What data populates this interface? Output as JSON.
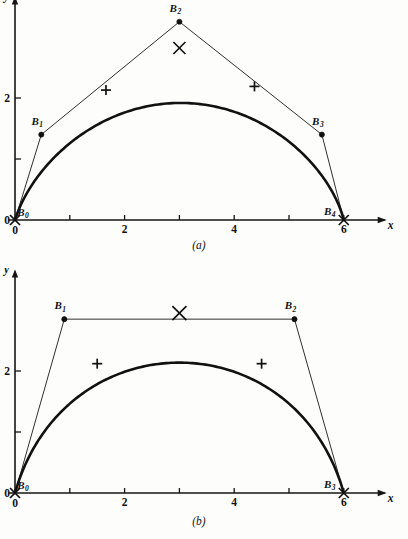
{
  "document": {
    "background_color": "#fdfdfb",
    "ink_color": "#111111"
  },
  "figures": [
    {
      "id": "a",
      "caption": "(a)",
      "axes": {
        "x_label": "x",
        "y_label": "y",
        "origin_label_y": "0",
        "origin_label_x": "0",
        "x_ticks": [
          {
            "value": 0,
            "label": "0"
          },
          {
            "value": 1,
            "label": ""
          },
          {
            "value": 2,
            "label": "2"
          },
          {
            "value": 3,
            "label": ""
          },
          {
            "value": 4,
            "label": "4"
          },
          {
            "value": 5,
            "label": ""
          },
          {
            "value": 6,
            "label": "6"
          }
        ],
        "y_ticks": [
          {
            "value": 1,
            "label": ""
          },
          {
            "value": 2,
            "label": "2"
          }
        ],
        "xlim": [
          0,
          6.6
        ],
        "ylim": [
          0,
          3.6
        ]
      },
      "control_points": [
        {
          "name": "B",
          "sub": "0",
          "x": 0.0,
          "y": 0.0,
          "label_dx": 8,
          "label_dy": -4
        },
        {
          "name": "B",
          "sub": "1",
          "x": 0.48,
          "y": 1.4,
          "label_dx": -4,
          "label_dy": -10
        },
        {
          "name": "B",
          "sub": "2",
          "x": 3.0,
          "y": 3.25,
          "label_dx": -4,
          "label_dy": -10
        },
        {
          "name": "B",
          "sub": "3",
          "x": 5.6,
          "y": 1.4,
          "label_dx": -4,
          "label_dy": -10
        },
        {
          "name": "B",
          "sub": "4",
          "x": 6.0,
          "y": 0.0,
          "label_dx": -14,
          "label_dy": -5
        }
      ],
      "curve_markers": [
        {
          "type": "x",
          "x": 0.0,
          "y": 0.0,
          "size": 5
        },
        {
          "type": "plus",
          "x": 1.66,
          "y": 2.13,
          "size": 5
        },
        {
          "type": "x",
          "x": 3.0,
          "y": 2.82,
          "size": 6
        },
        {
          "type": "plus",
          "x": 4.37,
          "y": 2.19,
          "size": 5
        },
        {
          "type": "x",
          "x": 6.0,
          "y": 0.0,
          "size": 5
        }
      ]
    },
    {
      "id": "b",
      "caption": "(b)",
      "axes": {
        "x_label": "x",
        "y_label": "y",
        "origin_label_y": "0",
        "origin_label_x": "0",
        "x_ticks": [
          {
            "value": 0,
            "label": "0"
          },
          {
            "value": 1,
            "label": ""
          },
          {
            "value": 2,
            "label": "2"
          },
          {
            "value": 3,
            "label": ""
          },
          {
            "value": 4,
            "label": "4"
          },
          {
            "value": 5,
            "label": ""
          },
          {
            "value": 6,
            "label": "6"
          }
        ],
        "y_ticks": [
          {
            "value": 1,
            "label": ""
          },
          {
            "value": 2,
            "label": "2"
          }
        ],
        "xlim": [
          0,
          6.6
        ],
        "ylim": [
          0,
          3.6
        ]
      },
      "control_points": [
        {
          "name": "B",
          "sub": "0",
          "x": 0.0,
          "y": 0.0,
          "label_dx": 8,
          "label_dy": -4
        },
        {
          "name": "B",
          "sub": "1",
          "x": 0.9,
          "y": 2.85,
          "label_dx": -4,
          "label_dy": -10
        },
        {
          "name": "B",
          "sub": "2",
          "x": 5.1,
          "y": 2.85,
          "label_dx": -4,
          "label_dy": -10
        },
        {
          "name": "B",
          "sub": "3",
          "x": 6.0,
          "y": 0.0,
          "label_dx": -14,
          "label_dy": -5
        }
      ],
      "curve_markers": [
        {
          "type": "x",
          "x": 0.0,
          "y": 0.0,
          "size": 5
        },
        {
          "type": "plus",
          "x": 1.5,
          "y": 2.12,
          "size": 5
        },
        {
          "type": "x",
          "x": 3.0,
          "y": 2.95,
          "size": 7
        },
        {
          "type": "plus",
          "x": 4.5,
          "y": 2.12,
          "size": 5
        },
        {
          "type": "x",
          "x": 6.0,
          "y": 0.0,
          "size": 5
        }
      ]
    }
  ],
  "chart_data": {
    "type": "line",
    "title": "",
    "charts": [
      {
        "id": "a",
        "caption": "(a)",
        "type": "line",
        "xlabel": "x",
        "ylabel": "y",
        "xlim": [
          0,
          6.6
        ],
        "ylim": [
          0,
          3.6
        ],
        "xticks": [
          0,
          1,
          2,
          3,
          4,
          5,
          6
        ],
        "xtick_labels": [
          "0",
          "",
          "2",
          "",
          "4",
          "",
          "6"
        ],
        "yticks": [
          1,
          2
        ],
        "ytick_labels": [
          "",
          "2"
        ],
        "grid": false,
        "legend": "none",
        "series": [
          {
            "name": "control polygon",
            "style": "thin-polyline",
            "x": [
              0.0,
              0.48,
              3.0,
              5.6,
              6.0
            ],
            "y": [
              0.0,
              1.4,
              3.25,
              1.4,
              0.0
            ]
          },
          {
            "name": "bezier curve (degree 4)",
            "style": "thick-curve",
            "x": [
              0.0,
              0.6,
              1.2,
              1.66,
              2.2,
              3.0,
              3.8,
              4.37,
              4.9,
              5.5,
              6.0
            ],
            "y": [
              0.0,
              1.12,
              1.78,
              2.13,
              2.5,
              2.82,
              2.5,
              2.19,
              1.75,
              1.0,
              0.0
            ]
          }
        ],
        "annotations": [
          {
            "text": "B0",
            "x": 0.0,
            "y": 0.0
          },
          {
            "text": "B1",
            "x": 0.48,
            "y": 1.4
          },
          {
            "text": "B2",
            "x": 3.0,
            "y": 3.25
          },
          {
            "text": "B3",
            "x": 5.6,
            "y": 1.4
          },
          {
            "text": "B4",
            "x": 6.0,
            "y": 0.0
          }
        ],
        "markers": [
          {
            "type": "x",
            "x": 0.0,
            "y": 0.0
          },
          {
            "type": "plus",
            "x": 1.66,
            "y": 2.13
          },
          {
            "type": "x",
            "x": 3.0,
            "y": 2.82
          },
          {
            "type": "plus",
            "x": 4.37,
            "y": 2.19
          },
          {
            "type": "x",
            "x": 6.0,
            "y": 0.0
          }
        ]
      },
      {
        "id": "b",
        "caption": "(b)",
        "type": "line",
        "xlabel": "x",
        "ylabel": "y",
        "xlim": [
          0,
          6.6
        ],
        "ylim": [
          0,
          3.6
        ],
        "xticks": [
          0,
          1,
          2,
          3,
          4,
          5,
          6
        ],
        "xtick_labels": [
          "0",
          "",
          "2",
          "",
          "4",
          "",
          "6"
        ],
        "yticks": [
          1,
          2
        ],
        "ytick_labels": [
          "",
          "2"
        ],
        "grid": false,
        "legend": "none",
        "series": [
          {
            "name": "control polygon",
            "style": "thin-polyline",
            "x": [
              0.0,
              0.9,
              5.1,
              6.0
            ],
            "y": [
              0.0,
              2.85,
              2.85,
              0.0
            ]
          },
          {
            "name": "bezier curve (degree 3)",
            "style": "thick-curve",
            "x": [
              0.0,
              0.5,
              1.0,
              1.5,
              2.0,
              2.5,
              3.0,
              3.5,
              4.0,
              4.5,
              5.0,
              5.5,
              6.0
            ],
            "y": [
              0.0,
              1.05,
              1.72,
              2.12,
              2.55,
              2.82,
              2.95,
              2.82,
              2.55,
              2.12,
              1.72,
              1.05,
              0.0
            ]
          }
        ],
        "annotations": [
          {
            "text": "B0",
            "x": 0.0,
            "y": 0.0
          },
          {
            "text": "B1",
            "x": 0.9,
            "y": 2.85
          },
          {
            "text": "B2",
            "x": 5.1,
            "y": 2.85
          },
          {
            "text": "B3",
            "x": 6.0,
            "y": 0.0
          }
        ],
        "markers": [
          {
            "type": "x",
            "x": 0.0,
            "y": 0.0
          },
          {
            "type": "plus",
            "x": 1.5,
            "y": 2.12
          },
          {
            "type": "x",
            "x": 3.0,
            "y": 2.95
          },
          {
            "type": "plus",
            "x": 4.5,
            "y": 2.12
          },
          {
            "type": "x",
            "x": 6.0,
            "y": 0.0
          }
        ]
      }
    ]
  }
}
